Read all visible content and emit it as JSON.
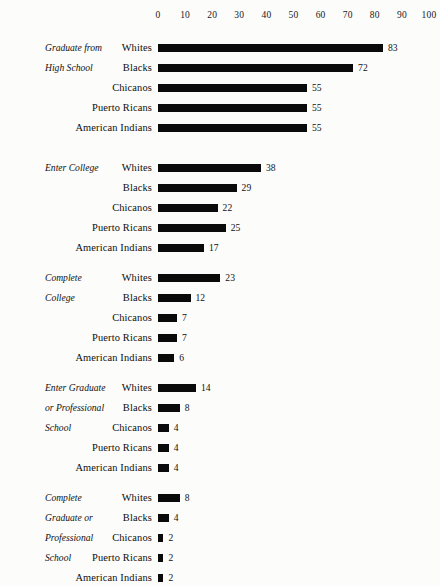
{
  "chart_data": {
    "type": "bar",
    "title": "",
    "subtitle": "",
    "xlabel": "",
    "ylabel": "",
    "orientation": "horizontal",
    "xlim": [
      0,
      100
    ],
    "grid": false,
    "legend": null,
    "axis_ticks": [
      0,
      10,
      20,
      30,
      40,
      50,
      60,
      70,
      80,
      90,
      100
    ],
    "categories": [
      "Whites",
      "Blacks",
      "Chicanos",
      "Puerto Ricans",
      "American Indians"
    ],
    "groups": [
      {
        "caption_lines": [
          "Graduate from",
          "High School"
        ],
        "label": "Graduate from High School",
        "rows": [
          {
            "category": "Whites",
            "value": 83
          },
          {
            "category": "Blacks",
            "value": 72
          },
          {
            "category": "Chicanos",
            "value": 55
          },
          {
            "category": "Puerto Ricans",
            "value": 55
          },
          {
            "category": "American Indians",
            "value": 55
          }
        ]
      },
      {
        "caption_lines": [
          "Enter College"
        ],
        "label": "Enter College",
        "rows": [
          {
            "category": "Whites",
            "value": 38
          },
          {
            "category": "Blacks",
            "value": 29
          },
          {
            "category": "Chicanos",
            "value": 22
          },
          {
            "category": "Puerto Ricans",
            "value": 25
          },
          {
            "category": "American Indians",
            "value": 17
          }
        ]
      },
      {
        "caption_lines": [
          "Complete",
          "College"
        ],
        "label": "Complete College",
        "rows": [
          {
            "category": "Whites",
            "value": 23
          },
          {
            "category": "Blacks",
            "value": 12
          },
          {
            "category": "Chicanos",
            "value": 7
          },
          {
            "category": "Puerto Ricans",
            "value": 7
          },
          {
            "category": "American Indians",
            "value": 6
          }
        ]
      },
      {
        "caption_lines": [
          "Enter Graduate",
          "or Professional",
          "School"
        ],
        "label": "Enter Graduate or Professional School",
        "rows": [
          {
            "category": "Whites",
            "value": 14
          },
          {
            "category": "Blacks",
            "value": 8
          },
          {
            "category": "Chicanos",
            "value": 4
          },
          {
            "category": "Puerto Ricans",
            "value": 4
          },
          {
            "category": "American Indians",
            "value": 4
          }
        ]
      },
      {
        "caption_lines": [
          "Complete",
          "Graduate or",
          "Professional",
          "School"
        ],
        "label": "Complete Graduate or Professional School",
        "rows": [
          {
            "category": "Whites",
            "value": 8
          },
          {
            "category": "Blacks",
            "value": 4
          },
          {
            "category": "Chicanos",
            "value": 2
          },
          {
            "category": "Puerto Ricans",
            "value": 2
          },
          {
            "category": "American Indians",
            "value": 2
          }
        ]
      }
    ],
    "colors": {
      "bar": "#0a0a0a",
      "text": "#111111",
      "background": "#fcfcfb"
    }
  },
  "layout": {
    "axis_origin_x": 158,
    "axis_px_per_unit": 2.71,
    "row_height": 20,
    "group_top_offsets": [
      38,
      158,
      268,
      378,
      488
    ]
  }
}
